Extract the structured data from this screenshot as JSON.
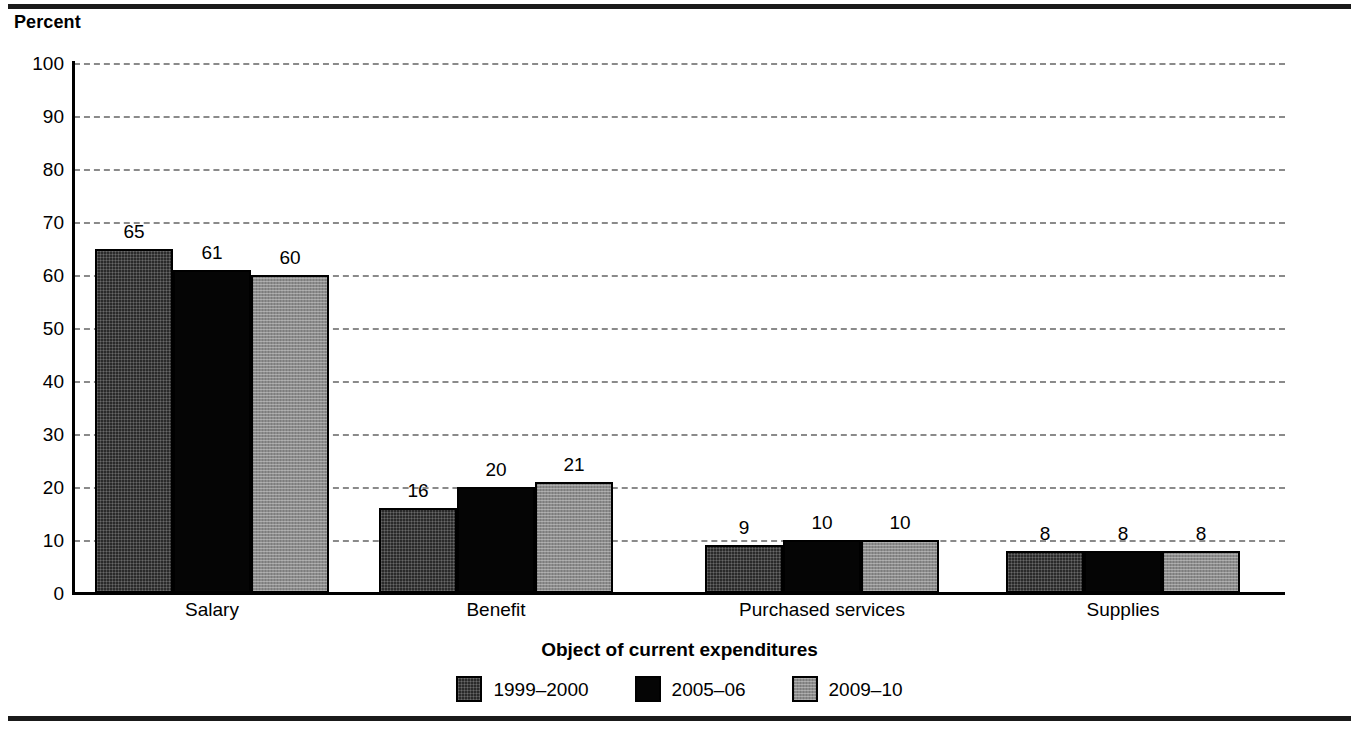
{
  "chart_data": {
    "type": "bar",
    "title": "",
    "subtitle": "",
    "xlabel": "Object of current expenditures",
    "ylabel": "Percent",
    "ylim": [
      0,
      100
    ],
    "ytick_step": 10,
    "yticks": [
      100,
      90,
      80,
      70,
      60,
      50,
      40,
      30,
      20,
      10,
      0
    ],
    "grid": true,
    "grid_style": "dashed-horizontal",
    "legend_position": "bottom-center",
    "categories": [
      "Salary",
      "Benefit",
      "Purchased services",
      "Supplies"
    ],
    "series": [
      {
        "name": "1999–2000",
        "values": [
          65,
          16,
          9,
          8
        ],
        "color": "#2a2a2a",
        "fill": "dark-crosshatch"
      },
      {
        "name": "2005–06",
        "values": [
          61,
          20,
          10,
          8
        ],
        "color": "#050505",
        "fill": "solid-black"
      },
      {
        "name": "2009–10",
        "values": [
          60,
          21,
          10,
          8
        ],
        "color": "#8d8d8d",
        "fill": "gray-stipple"
      }
    ],
    "data_labels": [
      [
        "65",
        "61",
        "60"
      ],
      [
        "16",
        "20",
        "21"
      ],
      [
        "9",
        "10",
        "10"
      ],
      [
        "8",
        "8",
        "8"
      ]
    ]
  },
  "axis": {
    "unit_label": "Percent",
    "x_title": "Object of current expenditures",
    "y_tick_labels": [
      "100",
      "90",
      "80",
      "70",
      "60",
      "50",
      "40",
      "30",
      "20",
      "10",
      "0"
    ],
    "category_labels": [
      "Salary",
      "Benefit",
      "Purchased services",
      "Supplies"
    ]
  },
  "legend": {
    "items": [
      {
        "label": "1999–2000"
      },
      {
        "label": "2005–06"
      },
      {
        "label": "2009–10"
      }
    ]
  },
  "colors": {
    "series_1": "#2a2a2a",
    "series_2": "#050505",
    "series_3": "#8d8d8d",
    "gridline": "#8a8a8a",
    "axis": "#000000",
    "rule": "#1a1a1a",
    "background": "#ffffff"
  }
}
